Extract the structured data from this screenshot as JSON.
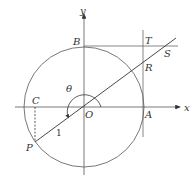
{
  "diagram": {
    "type": "unit-circle-trigonometry",
    "axes": {
      "x_label": "x",
      "y_label": "y"
    },
    "points": {
      "origin": "O",
      "A": "A",
      "B": "B",
      "T": "T",
      "R": "R",
      "S": "S",
      "C": "C",
      "P": "P"
    },
    "angle_label": "θ",
    "radius_label": "1",
    "colors": {
      "stroke": "#444444",
      "background": "#ffffff"
    }
  }
}
